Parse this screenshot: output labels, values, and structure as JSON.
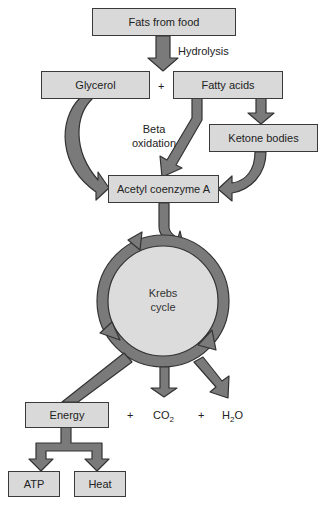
{
  "diagram": {
    "nodes": {
      "fats_from_food": "Fats from food",
      "glycerol": "Glycerol",
      "fatty_acids": "Fatty acids",
      "ketone_bodies": "Ketone bodies",
      "acetyl_coa": "Acetyl coenzyme A",
      "krebs_line1": "Krebs",
      "krebs_line2": "cycle",
      "energy": "Energy",
      "atp": "ATP",
      "heat": "Heat"
    },
    "labels": {
      "hydrolysis": "Hydrolysis",
      "beta_line1": "Beta",
      "beta_line2": "oxidation",
      "plus": "+",
      "co2_main": "CO",
      "co2_sub": "2",
      "h2o_h": "H",
      "h2o_sub": "2",
      "h2o_o": "O"
    },
    "colors": {
      "box_fill": "#d9d9d9",
      "arrow_fill": "#7a7a7a",
      "outline": "#3a3a3a",
      "circle_fill": "#dcdcdc"
    }
  }
}
